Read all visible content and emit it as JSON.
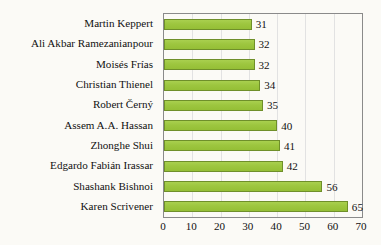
{
  "chart_data": {
    "type": "bar",
    "orientation": "horizontal",
    "title": "",
    "subtitle": "",
    "xlabel": "",
    "ylabel": "",
    "categories": [
      "Martin Keppert",
      "Ali Akbar Ramezanianpour",
      "Moisés Frías",
      "Christian Thienel",
      "Robert Černý",
      "Assem A.A. Hassan",
      "Zhonghe Shui",
      "Edgardo Fabián Irassar",
      "Shashank Bishnoi",
      "Karen Scrivener"
    ],
    "values": [
      31,
      32,
      32,
      34,
      35,
      40,
      41,
      42,
      56,
      65
    ],
    "data_labels": [
      "31",
      "32",
      "32",
      "34",
      "35",
      "40",
      "41",
      "42",
      "56",
      "65"
    ],
    "xlim": [
      0,
      70
    ],
    "xticks": [
      0,
      10,
      20,
      30,
      40,
      50,
      60,
      70
    ],
    "xtick_labels": [
      "0",
      "10",
      "20",
      "30",
      "40",
      "50",
      "60",
      "70"
    ],
    "grid": "vertical-only",
    "legend": "none",
    "colors": {
      "bar_fill": "#9dc63f",
      "bar_border": "#6f8f2a",
      "gridline": "#e2e2e2",
      "frame": "#8a8a8a",
      "text": "#111111",
      "background": "#fbfaf6"
    }
  }
}
